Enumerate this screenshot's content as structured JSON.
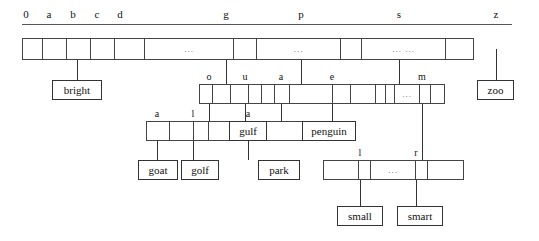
{
  "diagram": {
    "ellipsis": "...",
    "index_header": {
      "labels": [
        {
          "text": "0",
          "x": 26
        },
        {
          "text": "a",
          "x": 49
        },
        {
          "text": "b",
          "x": 73
        },
        {
          "text": "c",
          "x": 97
        },
        {
          "text": "d",
          "x": 120
        },
        {
          "text": "g",
          "x": 226
        },
        {
          "text": "p",
          "x": 301
        },
        {
          "text": "s",
          "x": 399
        },
        {
          "text": "z",
          "x": 496
        }
      ],
      "rule": {
        "x": 22,
        "y": 24,
        "width": 490
      }
    },
    "nodes": [
      {
        "id": "root",
        "name": "root-node",
        "x": 22,
        "y": 38,
        "height": 22,
        "cells": [
          {
            "w": 20,
            "text": ""
          },
          {
            "w": 24,
            "text": ""
          },
          {
            "w": 24,
            "text": ""
          },
          {
            "w": 24,
            "text": ""
          },
          {
            "w": 30,
            "text": ""
          },
          {
            "w": 89,
            "text": "..."
          },
          {
            "w": 23,
            "text": ""
          },
          {
            "w": 84,
            "text": "..."
          },
          {
            "w": 21,
            "text": ""
          },
          {
            "w": 84,
            "text": "... ..."
          },
          {
            "w": 27,
            "text": ""
          }
        ]
      },
      {
        "id": "g-node",
        "name": "node-g",
        "x": 199,
        "y": 84,
        "height": 20,
        "cells": [
          {
            "w": 13,
            "text": ""
          },
          {
            "w": 18,
            "text": ""
          },
          {
            "w": 18,
            "text": ""
          },
          {
            "w": 13,
            "text": ""
          },
          {
            "w": 13,
            "text": ""
          }
        ]
      },
      {
        "id": "p-node",
        "name": "node-p",
        "x": 274,
        "y": 84,
        "height": 20,
        "cells": [
          {
            "w": 15,
            "text": ""
          },
          {
            "w": 43,
            "text": ""
          },
          {
            "w": 18,
            "text": ""
          },
          {
            "w": 28,
            "text": ""
          }
        ]
      },
      {
        "id": "s-node",
        "name": "node-s",
        "x": 375,
        "y": 84,
        "height": 20,
        "cells": [
          {
            "w": 10,
            "text": ""
          },
          {
            "w": 9,
            "text": ""
          },
          {
            "w": 25,
            "text": "..."
          },
          {
            "w": 11,
            "text": ""
          },
          {
            "w": 13,
            "text": ""
          }
        ]
      },
      {
        "id": "go-node",
        "name": "node-go",
        "x": 146,
        "y": 121,
        "height": 20,
        "cells": [
          {
            "w": 23,
            "text": ""
          },
          {
            "w": 24,
            "text": ""
          },
          {
            "w": 15,
            "text": ""
          },
          {
            "w": 20,
            "text": ""
          }
        ]
      },
      {
        "id": "pa-node",
        "name": "node-pa",
        "x": 238,
        "y": 121,
        "height": 20,
        "cells": [
          {
            "w": 22,
            "text": ""
          },
          {
            "w": 59,
            "text": ""
          }
        ]
      },
      {
        "id": "sm-node",
        "name": "node-sm",
        "x": 323,
        "y": 160,
        "height": 20,
        "cells": [
          {
            "w": 35,
            "text": ""
          },
          {
            "w": 12,
            "text": ""
          },
          {
            "w": 45,
            "text": "..."
          },
          {
            "w": 12,
            "text": ""
          },
          {
            "w": 35,
            "text": ""
          }
        ]
      }
    ],
    "cell_labels": [
      {
        "text": "o",
        "x": 209,
        "y": 72
      },
      {
        "text": "u",
        "x": 245,
        "y": 72
      },
      {
        "text": "a",
        "x": 281,
        "y": 72
      },
      {
        "text": "e",
        "x": 332,
        "y": 72
      },
      {
        "text": "m",
        "x": 422,
        "y": 72
      },
      {
        "text": "a",
        "x": 157,
        "y": 109
      },
      {
        "text": "l",
        "x": 193,
        "y": 109
      },
      {
        "text": "a",
        "x": 248,
        "y": 109
      },
      {
        "text": "l",
        "x": 360,
        "y": 148
      },
      {
        "text": "r",
        "x": 416,
        "y": 148
      }
    ],
    "leaves": [
      {
        "name": "leaf-bright",
        "text": "bright",
        "x": 52,
        "y": 80,
        "w": 50,
        "h": 20
      },
      {
        "name": "leaf-gulf",
        "text": "gulf",
        "x": 229,
        "y": 121,
        "w": 38,
        "h": 20
      },
      {
        "name": "leaf-penguin",
        "text": "penguin",
        "x": 302,
        "y": 121,
        "w": 54,
        "h": 20
      },
      {
        "name": "leaf-zoo",
        "text": "zoo",
        "x": 477,
        "y": 80,
        "w": 37,
        "h": 20
      },
      {
        "name": "leaf-goat",
        "text": "goat",
        "x": 138,
        "y": 160,
        "w": 40,
        "h": 20
      },
      {
        "name": "leaf-golf",
        "text": "golf",
        "x": 181,
        "y": 160,
        "w": 38,
        "h": 20
      },
      {
        "name": "leaf-park",
        "text": "park",
        "x": 258,
        "y": 160,
        "w": 42,
        "h": 20
      },
      {
        "name": "leaf-small",
        "text": "small",
        "x": 337,
        "y": 206,
        "w": 46,
        "h": 20
      },
      {
        "name": "leaf-smart",
        "text": "smart",
        "x": 397,
        "y": 206,
        "w": 46,
        "h": 20
      }
    ],
    "connectors": [
      {
        "name": "link-root-b-to-bright",
        "x": 77,
        "y": 49,
        "h": 31
      },
      {
        "name": "link-root-g-to-gnode",
        "x": 226,
        "y": 49,
        "h": 35
      },
      {
        "name": "link-root-p-to-pnode",
        "x": 301,
        "y": 49,
        "h": 35
      },
      {
        "name": "link-root-s-to-snode",
        "x": 399,
        "y": 49,
        "h": 35
      },
      {
        "name": "link-root-z-to-zoo",
        "x": 496,
        "y": 49,
        "h": 31
      },
      {
        "name": "link-g-o-to-gonode",
        "x": 209,
        "y": 94,
        "h": 27
      },
      {
        "name": "link-g-u-to-gulf",
        "x": 245,
        "y": 94,
        "h": 27
      },
      {
        "name": "link-p-a-to-panode",
        "x": 281,
        "y": 94,
        "h": 27
      },
      {
        "name": "link-p-e-to-penguin",
        "x": 332,
        "y": 94,
        "h": 27
      },
      {
        "name": "link-s-m-to-smnode",
        "x": 422,
        "y": 94,
        "h": 66
      },
      {
        "name": "link-go-a-to-goat",
        "x": 157,
        "y": 131,
        "h": 29
      },
      {
        "name": "link-go-l-to-golf",
        "x": 193,
        "y": 131,
        "h": 29
      },
      {
        "name": "link-pa-a-to-park",
        "x": 248,
        "y": 131,
        "h": 29
      },
      {
        "name": "link-sm-l-to-small",
        "x": 360,
        "y": 170,
        "h": 36
      },
      {
        "name": "link-sm-r-to-smart",
        "x": 416,
        "y": 170,
        "h": 36
      }
    ]
  }
}
